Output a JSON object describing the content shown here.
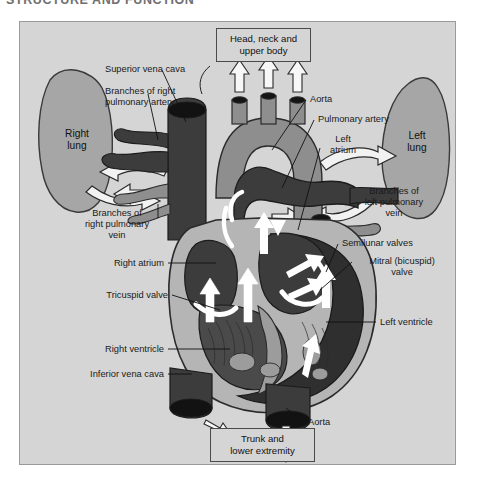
{
  "page": {
    "running_header": "STRUCTURE AND FUNCTION",
    "background_color": "#ffffff",
    "figure_background": "#d5d5d5",
    "figure_border_color": "#9a9a9a"
  },
  "diagram": {
    "type": "anatomical-illustration",
    "colors": {
      "deoxygenated": "#3c3c3c",
      "oxygenated": "#8e8e8e",
      "muscle": "#b5b5b5",
      "lung_fill": "#a6a6a6",
      "outline": "#2b2b2b",
      "flow_arrow": "#ffffff",
      "valve": "#ffffff"
    },
    "boxes": [
      {
        "id": "head-neck",
        "line1": "Head, neck and",
        "line2": "upper body"
      },
      {
        "id": "trunk-lower",
        "line1": "Trunk and",
        "line2": "lower extremity"
      }
    ],
    "lungs": [
      {
        "id": "right-lung",
        "line1": "Right",
        "line2": "lung"
      },
      {
        "id": "left-lung",
        "line1": "Left",
        "line2": "lung"
      }
    ],
    "labels_left": [
      {
        "id": "superior-vena-cava",
        "text": "Superior vena cava"
      },
      {
        "id": "branches-right-pulmonary-artery",
        "line1": "Branches of right",
        "line2": "pulmonary artery"
      },
      {
        "id": "branches-right-pulmonary-vein",
        "line1": "Branches of",
        "line2": "right pulmonary",
        "line3": "vein"
      },
      {
        "id": "right-atrium",
        "text": "Right atrium"
      },
      {
        "id": "tricuspid-valve",
        "text": "Tricuspid valve"
      },
      {
        "id": "right-ventricle",
        "text": "Right ventricle"
      },
      {
        "id": "inferior-vena-cava",
        "text": "Inferior vena cava"
      }
    ],
    "labels_right": [
      {
        "id": "aorta-top",
        "text": "Aorta"
      },
      {
        "id": "pulmonary-artery",
        "text": "Pulmonary artery"
      },
      {
        "id": "left-atrium",
        "line1": "Left",
        "line2": "atrium"
      },
      {
        "id": "branches-left-pulmonary-vein",
        "line1": "Branches of",
        "line2": "left pulmonary",
        "line3": "vein"
      },
      {
        "id": "semilunar-valves",
        "text": "Semilunar valves"
      },
      {
        "id": "mitral-valve",
        "line1": "Mitral (bicuspid)",
        "line2": "valve"
      },
      {
        "id": "left-ventricle",
        "text": "Left ventricle"
      },
      {
        "id": "aorta-bottom",
        "text": "Aorta"
      }
    ]
  }
}
